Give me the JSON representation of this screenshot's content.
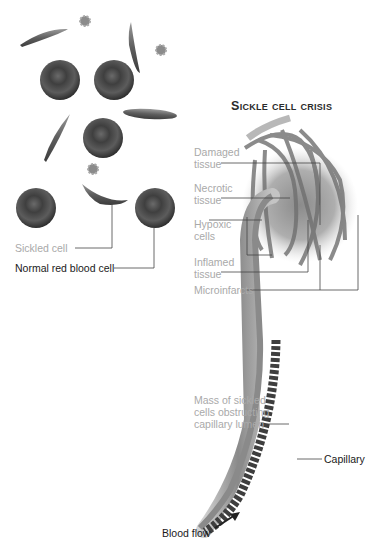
{
  "title": "Sickle cell crisis",
  "left_panel": {
    "labels": {
      "sickled_cell": "Sickled cell",
      "normal_cell": "Normal red blood cell"
    }
  },
  "right_panel": {
    "labels": {
      "damaged_tissue": "Damaged\ntissue",
      "necrotic_tissue": "Necrotic\ntissue",
      "hypoxic_cells": "Hypoxic\ncells",
      "inflamed_tissue": "Inflamed\ntissue",
      "microinfarcts": "Microinfarcts",
      "mass_sickled": "Mass of sickled\ncells obstructing\ncapillary lumen",
      "capillary": "Capillary",
      "blood_flow": "Blood flow"
    }
  },
  "colors": {
    "rbc": "#5a5a5a",
    "vessel": "#8a8a8a",
    "label_gray": "#a9a9a9",
    "label_dark": "#1a1a1a"
  }
}
